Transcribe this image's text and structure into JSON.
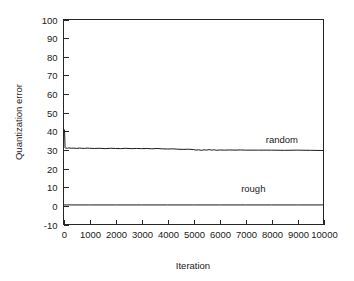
{
  "chart_data": {
    "type": "line",
    "title": "",
    "xlabel": "Iteration",
    "ylabel": "Quantization error",
    "xlim": [
      0,
      10000
    ],
    "ylim": [
      -10,
      100
    ],
    "grid": false,
    "legend_position": "inline-annotation",
    "xticks": [
      "0",
      "1000",
      "2000",
      "3000",
      "4000",
      "5000",
      "6000",
      "7000",
      "8000",
      "9000",
      "10000"
    ],
    "xtick_values": [
      0,
      1000,
      2000,
      3000,
      4000,
      5000,
      6000,
      7000,
      8000,
      9000,
      10000
    ],
    "yticks": [
      "100",
      "90",
      "80",
      "70",
      "60",
      "50",
      "40",
      "30",
      "20",
      "10",
      "0",
      "-10"
    ],
    "ytick_values": [
      100,
      90,
      80,
      70,
      60,
      50,
      40,
      30,
      20,
      10,
      0,
      -10
    ],
    "annotations": [
      {
        "text": "random",
        "x": 8400,
        "y": 33.5
      },
      {
        "text": "rough",
        "x": 7300,
        "y": 7.5
      }
    ],
    "series": [
      {
        "name": "random",
        "color": "#1a1a1a",
        "x": [
          0,
          20,
          40,
          60,
          80,
          100,
          150,
          200,
          300,
          400,
          500,
          600,
          700,
          800,
          900,
          1000,
          1200,
          1400,
          1600,
          1800,
          2000,
          2200,
          2400,
          2600,
          2800,
          3000,
          3200,
          3400,
          3600,
          3800,
          4000,
          4200,
          4400,
          4600,
          4800,
          5000,
          5100,
          5200,
          5300,
          5400,
          5500,
          5600,
          5700,
          5800,
          5900,
          6000,
          6200,
          6400,
          6600,
          6800,
          7000,
          7500,
          8000,
          8500,
          9000,
          9500,
          10000
        ],
        "y": [
          41.0,
          41.0,
          40.8,
          31.2,
          30.9,
          31.0,
          30.9,
          31.1,
          30.9,
          31.0,
          30.8,
          31.0,
          30.9,
          30.8,
          31.0,
          30.9,
          30.8,
          30.9,
          30.7,
          30.9,
          30.8,
          30.7,
          30.9,
          30.7,
          30.8,
          30.7,
          30.8,
          30.6,
          30.8,
          30.6,
          30.5,
          30.6,
          30.4,
          30.3,
          30.4,
          30.2,
          29.9,
          30.1,
          29.8,
          30.1,
          29.9,
          30.2,
          29.9,
          30.1,
          29.8,
          30.0,
          29.9,
          30.0,
          29.9,
          30.0,
          29.9,
          29.9,
          29.9,
          29.8,
          29.9,
          29.8,
          29.7
        ]
      },
      {
        "name": "rough",
        "color": "#1a1a1a",
        "x": [
          0,
          1000,
          2000,
          3000,
          4000,
          5000,
          6000,
          7000,
          8000,
          9000,
          10000
        ],
        "y": [
          0.5,
          0.5,
          0.5,
          0.5,
          0.5,
          0.5,
          0.5,
          0.5,
          0.5,
          0.5,
          0.5
        ]
      }
    ]
  },
  "figure": {
    "background_color": "#ffffff",
    "axis_color": "#262626",
    "line_color": "#1a1a1a"
  }
}
